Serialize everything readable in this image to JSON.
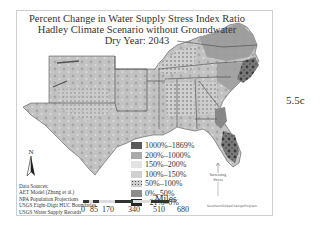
{
  "map": {
    "title_lines": [
      "Percent Change in Water Supply Stress Index Ratio",
      "Hadley Climate Scenario without Groundwater",
      "Dry Year: 2043"
    ],
    "legend": {
      "items": [
        {
          "label": "1000%–1869%",
          "color": "#5a5a5a",
          "pattern": false
        },
        {
          "label": "200%–1000%",
          "color": "#a9a9a9",
          "pattern": false
        },
        {
          "label": "150%–200%",
          "color": "#e3e3e3",
          "pattern": false
        },
        {
          "label": "100%–150%",
          "color": "#d0d0d0",
          "pattern": false
        },
        {
          "label": "50%–100%",
          "color": "#c6c6c6",
          "pattern": true
        },
        {
          "label": "0%–50%",
          "color": "#8c8c8c",
          "pattern": false
        },
        {
          "label": "−21%–0%",
          "color": "#262626",
          "pattern": false
        }
      ]
    },
    "north_arrow": {
      "label": "N",
      "icon": "north-arrow-icon"
    },
    "data_sources": [
      "Data Sources:",
      "AET Model (Zhang et al.)",
      "NPA Population Projections",
      "USGS Eight-Digit HUC Boundaries",
      "USGS Water Supply Records"
    ],
    "scale_bar": {
      "ticks": [
        "0",
        "85",
        "170",
        "340",
        "510",
        "680"
      ],
      "unit": "Miles"
    },
    "stress_indicator": {
      "label_line1": "Increasing",
      "label_line2": "Stress"
    },
    "credit": "SouthernGlobalChangeProgram",
    "colors": {
      "frame": "#cfcfcf",
      "text": "#333333",
      "land_base": "#bdbdbd",
      "water": "#ffffff"
    }
  },
  "figure_label": "5.5c"
}
